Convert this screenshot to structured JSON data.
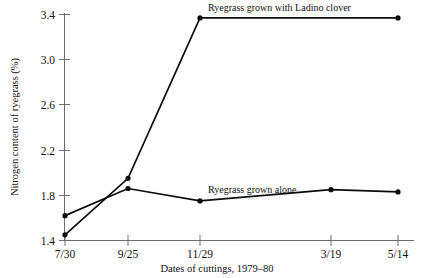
{
  "chart_data": {
    "type": "line",
    "title": "",
    "xlabel": "Dates of cuttings, 1979–80",
    "ylabel": "Nitrogen content of ryegrass (%)",
    "categories": [
      "7/30",
      "9/25",
      "11/29",
      "3/19",
      "5/14"
    ],
    "ylim": [
      1.4,
      3.4
    ],
    "yticks": [
      "1.4",
      "1.8",
      "2.2",
      "2.6",
      "3.0",
      "3.4"
    ],
    "ytick_values": [
      1.4,
      1.8,
      2.2,
      2.6,
      3.0,
      3.4
    ],
    "grid": false,
    "legend_position": "inline-annotation",
    "series": [
      {
        "name": "Ryegrass grown with Ladino clover",
        "values": [
          1.45,
          1.95,
          3.37,
          3.37,
          3.37
        ],
        "marker_indices": [
          0,
          1,
          2,
          4
        ]
      },
      {
        "name": "Ryegrass grown alone",
        "values": [
          1.62,
          1.86,
          1.75,
          1.85,
          1.83
        ],
        "marker_indices": [
          0,
          1,
          2,
          3,
          4
        ]
      }
    ],
    "annotations": [
      {
        "text": "Ryegrass grown with Ladino clover",
        "x": 1.48,
        "y": 3.52
      },
      {
        "text": "Ryegrass grown alone",
        "x": 2.55,
        "y": 1.88
      }
    ]
  },
  "axis": {
    "y_title": "Nitrogen content of ryegrass (%)",
    "x_title": "Dates of cuttings, 1979–80",
    "ytick_0": "1.4",
    "ytick_1": "1.8",
    "ytick_2": "2.2",
    "ytick_3": "2.6",
    "ytick_4": "3.0",
    "ytick_5": "3.4",
    "xtick_0": "7/30",
    "xtick_1": "9/25",
    "xtick_2": "11/29",
    "xtick_3": "3/19",
    "xtick_4": "5/14"
  },
  "labels": {
    "clover_series": "Ryegrass grown with Ladino clover",
    "alone_series": "Ryegrass grown alone"
  },
  "colors": {
    "line": "#0b0b0b",
    "axis": "#6d6d6d",
    "text": "#111111",
    "background": "#ffffff"
  }
}
